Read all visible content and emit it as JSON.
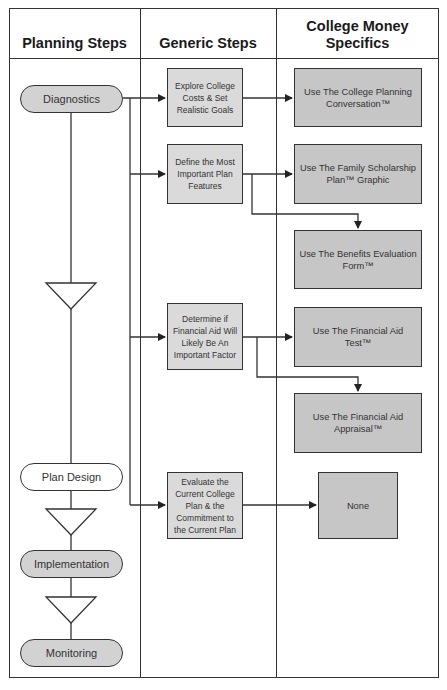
{
  "headers": {
    "planning_steps": "Planning Steps",
    "generic_steps": "Generic Steps",
    "college_money_specifics": "College Money Specifics"
  },
  "planning_steps": [
    {
      "label": "Diagnostics",
      "shaded": true
    },
    {
      "label": "Plan Design",
      "shaded": false
    },
    {
      "label": "Implementation",
      "shaded": true
    },
    {
      "label": "Monitoring",
      "shaded": true
    }
  ],
  "generic_steps": [
    {
      "label": "Explore College Costs & Set Realistic Goals"
    },
    {
      "label": "Define the Most Important Plan Features"
    },
    {
      "label": "Determine if Financial Aid Will Likely Be An Important Factor"
    },
    {
      "label": "Evaluate the Current College Plan & the Commitment to the Current Plan"
    }
  ],
  "specifics": [
    {
      "label": "Use The College Planning Conversation™"
    },
    {
      "label": "Use The Family Scholarship Plan™ Graphic"
    },
    {
      "label": "Use The Benefits Evaluation Form™"
    },
    {
      "label": "Use The Financial Aid Test™"
    },
    {
      "label": "Use The Financial Aid Appraisal™"
    },
    {
      "label": "None"
    }
  ],
  "colors": {
    "line": "#333333",
    "generic_box_fill": "#dadada",
    "specific_box_fill": "#c6c6c6",
    "pill_shaded_fill": "#d2d2d2"
  }
}
